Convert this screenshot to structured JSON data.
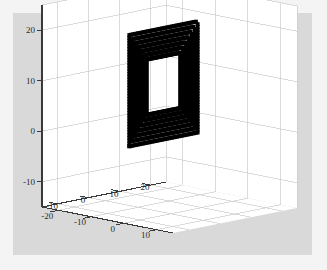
{
  "figure": {
    "type": "matlab-3d-scatter",
    "background_outer": "#f4f4f4",
    "background_figure": "#d9d9d9",
    "axes_background": "#ffffff",
    "grid_color": "#cccccc",
    "axis_line_color": "#3a3a3a",
    "marker_color": "#000000",
    "tick_label_color": "#2b2b2b"
  },
  "chart_data": {
    "type": "scatter",
    "title": "",
    "xlabel": "",
    "ylabel": "",
    "zlabel": "",
    "projection": "3d",
    "grid": true,
    "legend": null,
    "xticks": [
      10,
      0,
      -10,
      -20
    ],
    "yticks": [
      -10,
      0,
      10,
      20
    ],
    "zticks": [
      20,
      10,
      0,
      -10
    ],
    "xtick_labels": [
      "10",
      "0",
      "-10",
      "-20"
    ],
    "ytick_labels": [
      "-10",
      "0",
      "10",
      "20"
    ],
    "ztick_labels": [
      "20",
      "10",
      "0",
      "-10"
    ],
    "xlim": [
      -25,
      15
    ],
    "ylim": [
      -15,
      25
    ],
    "zlim": [
      -15,
      25
    ],
    "marker": "square",
    "marker_size": 4,
    "series": [
      {
        "name": "square-ring",
        "description": "dense hollow square ring of black markers in a vertical plane",
        "outer_half_width": 11.0,
        "inner_half_width": 5.5,
        "center": [
          -4,
          2,
          10
        ],
        "n_points": 160
      }
    ]
  },
  "geometry": {
    "apex_back_top": [
      173,
      31
    ],
    "apex_front_bottom": [
      173,
      233
    ],
    "corner_left": [
      42,
      207
    ],
    "corner_right": [
      297,
      208
    ],
    "wall_top_left": [
      42,
      19
    ],
    "wall_top_right": [
      300,
      52
    ],
    "ring_bbox": [
      147,
      78,
      61,
      75
    ]
  }
}
